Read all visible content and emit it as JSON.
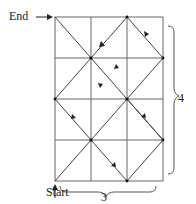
{
  "labels": {
    "end": "End",
    "start": "Start",
    "width": "3",
    "height": "4"
  },
  "grid": {
    "columns": 3,
    "rows": 4,
    "line_color": "#555555",
    "path_color": "#333333"
  },
  "arrows": {
    "end_arrow": "right-arrow",
    "start_arrow": "up-arrow"
  }
}
